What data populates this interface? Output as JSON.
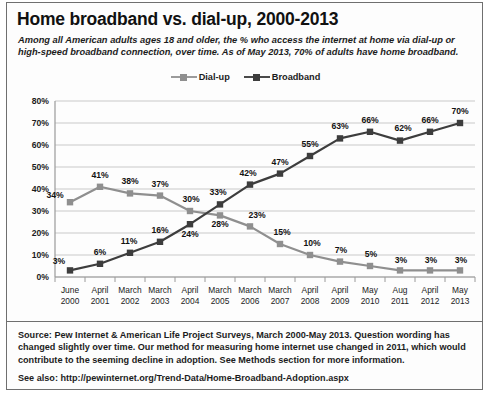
{
  "title": "Home broadband vs. dial-up, 2000-2013",
  "subtitle": "Among all American adults ages 18 and older, the % who access the internet at home via dial-up or high-speed broadband connection, over time. As of May 2013, 70% of adults have home broadband.",
  "legend": {
    "dialup_label": "Dial-up",
    "broadband_label": "Broadband"
  },
  "footer": {
    "source": "Source: Pew Internet & American Life Project Surveys, March 2000-May 2013. Question wording has changed slightly over time. Our method for measuring home internet use changed in 2011, which would contribute to the seeming decline in adoption. See Methods section for more information.",
    "see_also": "See also: http://pewinternet.org/Trend-Data/Home-Broadband-Adoption.aspx"
  },
  "chart_data": {
    "type": "line",
    "title": "Home broadband vs. dial-up, 2000-2013",
    "xlabel": "",
    "ylabel": "",
    "ylim": [
      0,
      80
    ],
    "ytick_labels": [
      "0%",
      "10%",
      "20%",
      "30%",
      "40%",
      "50%",
      "60%",
      "70%",
      "80%"
    ],
    "ytick_values": [
      0,
      10,
      20,
      30,
      40,
      50,
      60,
      70,
      80
    ],
    "grid": true,
    "legend_position": "top-center",
    "categories": [
      "June 2000",
      "April 2001",
      "March 2002",
      "March 2003",
      "April 2004",
      "March 2005",
      "March 2006",
      "March 2007",
      "April 2008",
      "April 2009",
      "May 2010",
      "Aug 2011",
      "April 2012",
      "May 2013"
    ],
    "category_lines": [
      [
        "June",
        "2000"
      ],
      [
        "April",
        "2001"
      ],
      [
        "March",
        "2002"
      ],
      [
        "March",
        "2003"
      ],
      [
        "April",
        "2004"
      ],
      [
        "March",
        "2005"
      ],
      [
        "March",
        "2006"
      ],
      [
        "March",
        "2007"
      ],
      [
        "April",
        "2008"
      ],
      [
        "April",
        "2009"
      ],
      [
        "May",
        "2010"
      ],
      [
        "Aug",
        "2011"
      ],
      [
        "April",
        "2012"
      ],
      [
        "May",
        "2013"
      ]
    ],
    "series": [
      {
        "name": "Dial-up",
        "color": "#8f8f8f",
        "values": [
          34,
          41,
          38,
          37,
          30,
          28,
          23,
          15,
          10,
          7,
          5,
          3,
          3,
          3
        ],
        "labels": [
          "34%",
          "41%",
          "38%",
          "37%",
          "30%",
          "28%",
          "23%",
          "15%",
          "10%",
          "7%",
          "5%",
          "3%",
          "3%",
          "3%"
        ]
      },
      {
        "name": "Broadband",
        "color": "#3d3d3d",
        "values": [
          3,
          6,
          11,
          16,
          24,
          33,
          42,
          47,
          55,
          63,
          66,
          62,
          66,
          70
        ],
        "labels": [
          "3%",
          "6%",
          "11%",
          "16%",
          "24%",
          "33%",
          "42%",
          "47%",
          "55%",
          "63%",
          "66%",
          "62%",
          "66%",
          "70%"
        ]
      }
    ]
  }
}
